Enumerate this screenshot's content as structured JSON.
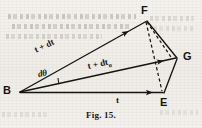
{
  "figure": {
    "caption": "Fig. 15.",
    "vertices": [
      {
        "id": "B",
        "label": "B",
        "x": 20,
        "y": 92
      },
      {
        "id": "E",
        "label": "E",
        "x": 163,
        "y": 92
      },
      {
        "id": "F",
        "label": "F",
        "x": 146,
        "y": 20
      },
      {
        "id": "G",
        "label": "G",
        "x": 178,
        "y": 58
      }
    ],
    "vectors": [
      {
        "id": "BF",
        "label": "t + dt",
        "from": "B",
        "to": "F",
        "style": "solid",
        "arrow": true
      },
      {
        "id": "BG",
        "label": "t + dt",
        "label_sub": "o",
        "from": "B",
        "to": "G",
        "style": "solid",
        "arrow": true
      },
      {
        "id": "BE",
        "label": "t",
        "from": "B",
        "to": "E",
        "style": "solid",
        "arrow": true
      }
    ],
    "edges": [
      {
        "id": "FG",
        "from": "F",
        "to": "G",
        "style": "solid",
        "arrow": false
      },
      {
        "id": "GE",
        "from": "G",
        "to": "E",
        "style": "solid",
        "arrow": false
      },
      {
        "id": "FE",
        "from": "F",
        "to": "E",
        "style": "dashed",
        "arrow": false
      },
      {
        "id": "FG-dashed",
        "from": "F",
        "to": "G",
        "style": "dashed",
        "arrow": false
      }
    ],
    "angles": [
      {
        "id": "dtheta",
        "label": "dθ",
        "at": "B",
        "between": [
          "BF",
          "BG"
        ]
      }
    ],
    "labels": {
      "vertex_B": "B",
      "vertex_E": "E",
      "vertex_F": "F",
      "vertex_G": "G",
      "vector_upper": "t + dt",
      "vector_middle_main": "t + dt",
      "vector_middle_sub": "o",
      "vector_base": "t",
      "angle": "dθ"
    },
    "colors": {
      "ink": "#141414",
      "paper": "#f2f0ec",
      "bleed_through": "#8c8780"
    }
  }
}
